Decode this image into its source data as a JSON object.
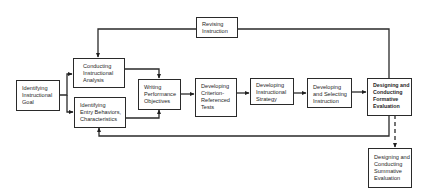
{
  "diagram": {
    "title": "",
    "nodes": [
      {
        "id": "revising",
        "lines": [
          "Revising",
          "Instruction"
        ]
      },
      {
        "id": "goal",
        "lines": [
          "Identifying",
          "Instructional",
          "Goal"
        ]
      },
      {
        "id": "analysis",
        "lines": [
          "Conducting",
          "Instructional",
          "Analysis"
        ]
      },
      {
        "id": "entry",
        "lines": [
          "Identifying",
          "Entry Behaviors,",
          "Characteristics"
        ]
      },
      {
        "id": "objectives",
        "lines": [
          "Writing",
          "Performance",
          "Objectives"
        ]
      },
      {
        "id": "tests",
        "lines": [
          "Developing",
          "Criterion-",
          "Referenced",
          "Tests"
        ]
      },
      {
        "id": "strategy",
        "lines": [
          "Developing",
          "Instructional",
          "Strategy"
        ]
      },
      {
        "id": "selecting",
        "lines": [
          "Developing",
          "and Selecting",
          "Instruction"
        ]
      },
      {
        "id": "formative",
        "lines": [
          "Designing and",
          "Conducting",
          "Formative",
          "Evaluation"
        ]
      },
      {
        "id": "summative",
        "lines": [
          "Designing and",
          "Conducting",
          "Summative",
          "Evaluation"
        ]
      }
    ],
    "edges": [
      {
        "from": "goal",
        "to": "analysis",
        "style": "solid"
      },
      {
        "from": "goal",
        "to": "entry",
        "style": "solid"
      },
      {
        "from": "analysis",
        "to": "objectives",
        "style": "solid"
      },
      {
        "from": "entry",
        "to": "objectives",
        "style": "solid"
      },
      {
        "from": "objectives",
        "to": "tests",
        "style": "solid"
      },
      {
        "from": "tests",
        "to": "strategy",
        "style": "solid"
      },
      {
        "from": "strategy",
        "to": "selecting",
        "style": "solid"
      },
      {
        "from": "selecting",
        "to": "formative",
        "style": "solid"
      },
      {
        "from": "formative",
        "to": "revising",
        "style": "solid"
      },
      {
        "from": "revising",
        "to": "analysis",
        "style": "solid"
      },
      {
        "from": "formative",
        "to": "entry",
        "style": "solid"
      },
      {
        "from": "formative",
        "to": "summative",
        "style": "dashed"
      }
    ]
  }
}
